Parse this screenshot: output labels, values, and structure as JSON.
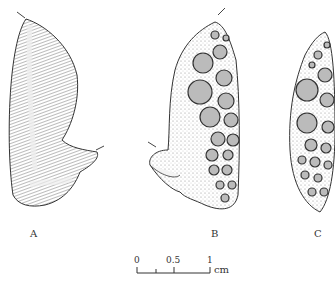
{
  "figure": {
    "panels": [
      {
        "label": "A",
        "view": "lateral view, smooth surface"
      },
      {
        "label": "B",
        "view": "view with tooth plates"
      },
      {
        "label": "C",
        "view": "tooth plate surface"
      }
    ],
    "scale_bar": {
      "ticks": [
        "0",
        "0.5",
        "1"
      ],
      "unit": "cm"
    }
  }
}
